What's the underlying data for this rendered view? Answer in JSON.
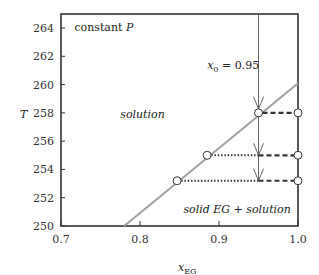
{
  "chart_data": {
    "type": "line",
    "title": "",
    "xlabel": "x_EG",
    "xlabel_main": "x",
    "xlabel_sub": "EG",
    "ylabel": "T",
    "xlim": [
      0.7,
      1.0
    ],
    "ylim": [
      250,
      265
    ],
    "xticks": [
      0.7,
      0.8,
      0.9,
      1.0
    ],
    "xtick_labels": [
      "0.7",
      "0.8",
      "0.9",
      "1.0"
    ],
    "yticks": [
      250,
      252,
      254,
      256,
      258,
      260,
      262,
      264
    ],
    "ytick_labels": [
      "250",
      "252",
      "254",
      "256",
      "258",
      "260",
      "262",
      "264"
    ],
    "grid": false,
    "series": [
      {
        "name": "freezing-point curve",
        "style": "solid",
        "color": "#a0a0a0",
        "x": [
          0.78,
          1.0
        ],
        "y": [
          250,
          260.1
        ]
      },
      {
        "name": "x0 path (vertical)",
        "style": "solid",
        "color": "#555555",
        "x": [
          0.95,
          0.95
        ],
        "y": [
          265,
          253.2
        ]
      }
    ],
    "tie_lines": [
      {
        "T": 258.0,
        "x_liquid": 0.95,
        "x_split": 0.95,
        "x_solid": 1.0
      },
      {
        "T": 255.0,
        "x_liquid": 0.885,
        "x_split": 0.95,
        "x_solid": 1.0
      },
      {
        "T": 253.2,
        "x_liquid": 0.847,
        "x_split": 0.95,
        "x_solid": 1.0
      }
    ],
    "arrows": [
      {
        "x": 0.95,
        "T": 258.0
      },
      {
        "x": 0.95,
        "T": 255.0
      },
      {
        "x": 0.95,
        "T": 253.2
      }
    ],
    "annotations": [
      {
        "text": "constant",
        "italic_suffix": "P",
        "x": 0.717,
        "y": 264.1
      },
      {
        "text_main": "x",
        "text_sub": "0",
        "text_rest": " = 0.95",
        "x": 0.885,
        "y": 261.4
      },
      {
        "text": "solution",
        "x": 0.775,
        "y": 257.9,
        "italic": true
      },
      {
        "text": "solid EG + solution",
        "x": 0.855,
        "y": 251.2,
        "italic": true
      }
    ],
    "legend": null
  },
  "colors": {
    "axis": "#333333",
    "curve": "#a0a0a0",
    "vertical": "#555555",
    "tie": "#333333",
    "marker_fill": "#ffffff",
    "marker_stroke": "#333333"
  }
}
